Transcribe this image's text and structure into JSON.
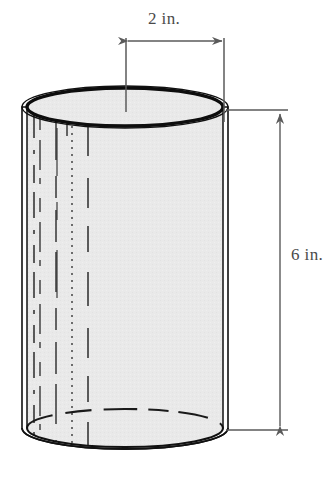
{
  "figure": {
    "shape": "cylinder",
    "labels": {
      "width": "2 in.",
      "height": "6 in."
    },
    "icons": {
      "width_dimension": "double-arrow-horizontal-icon",
      "height_dimension": "double-arrow-vertical-icon",
      "cylinder": "cylinder-shape-icon"
    },
    "colors": {
      "outline": "#111111",
      "fill": "#e9e9e9",
      "dimension_line": "#5a5a5a",
      "label_text": "#4a4a4a",
      "background": "#ffffff",
      "hidden_line": "#2a2a2a"
    },
    "geometry": {
      "top_ellipse_cx": 125,
      "top_ellipse_cy": 107,
      "top_ellipse_rx": 98,
      "top_ellipse_ry": 19,
      "bottom_ellipse_cy": 428,
      "body_top_y": 107,
      "body_bottom_y": 428,
      "wall_thickness": 5
    },
    "measurements": {
      "diameter_value": 2,
      "diameter_unit": "in.",
      "height_value": 6,
      "height_unit": "in."
    }
  }
}
